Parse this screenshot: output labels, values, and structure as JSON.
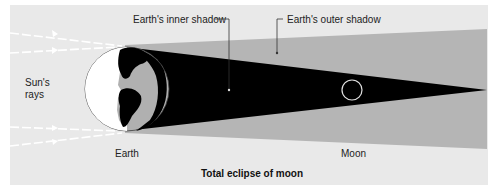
{
  "diagram": {
    "title": "Total eclipse of moon",
    "labels": {
      "inner_shadow": "Earth's inner shadow",
      "outer_shadow": "Earth's outer shadow",
      "sun_rays_line1": "Sun's",
      "sun_rays_line2": "rays",
      "earth": "Earth",
      "moon": "Moon"
    },
    "colors": {
      "background": "#e9e9e9",
      "outer_shadow": "#b5b5b5",
      "inner_shadow": "#000000",
      "earth_lit": "#ffffff",
      "earth_land": "#000000",
      "earth_ocean": "#b0b0b0",
      "moon_outline": "#e0e0e0",
      "rays": "#ffffff"
    }
  }
}
